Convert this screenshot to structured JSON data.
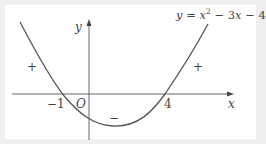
{
  "figure": {
    "equation_label": {
      "y": "y",
      "eq": " = ",
      "x": "x",
      "sup": "2",
      "rest1": " − 3",
      "x2": "x",
      "rest2": " − 4"
    },
    "axes": {
      "x_label": "x",
      "y_label": "y",
      "origin_label": "O"
    },
    "roots": [
      {
        "label": "−1",
        "value": -1
      },
      {
        "label": "4",
        "value": 4
      }
    ],
    "sign_labels": [
      {
        "region": "left",
        "sign": "+"
      },
      {
        "region": "between-roots",
        "sign": "−"
      },
      {
        "region": "right",
        "sign": "+"
      }
    ],
    "curve": {
      "equation": "y = x^2 - 3x - 4",
      "color": "#555555"
    }
  }
}
